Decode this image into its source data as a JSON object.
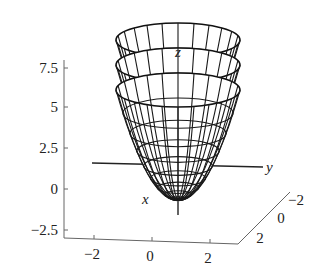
{
  "chart_data": {
    "type": "surface3d",
    "title": "",
    "surfaces": [
      {
        "name": "z = x^2 + y^2",
        "shift": 0
      },
      {
        "name": "z = x^2 + y^2 + 1",
        "shift": 1
      },
      {
        "name": "z = x^2 + y^2 + 2",
        "shift": 2
      }
    ],
    "axes": {
      "x": {
        "label": "x",
        "ticks": [
          "-2",
          "0",
          "2"
        ],
        "range": [
          -2,
          2
        ]
      },
      "y": {
        "label": "y",
        "ticks": [
          "-2",
          "0",
          "2"
        ],
        "range": [
          -2,
          2
        ]
      },
      "z": {
        "label": "z",
        "ticks": [
          "-2.5",
          "0",
          "2.5",
          "5",
          "7.5"
        ],
        "range": [
          -2.5,
          7.5
        ]
      }
    },
    "grid": false,
    "legend": null
  },
  "labels": {
    "z_axis": "z",
    "y_axis": "y",
    "x_axis": "x",
    "z_ticks": [
      "7.5",
      "5",
      "2.5",
      "0",
      "−2.5"
    ],
    "bottom_ticks": [
      "−2",
      "0",
      "2"
    ],
    "side_ticks": [
      "−2",
      "0",
      "2"
    ]
  }
}
